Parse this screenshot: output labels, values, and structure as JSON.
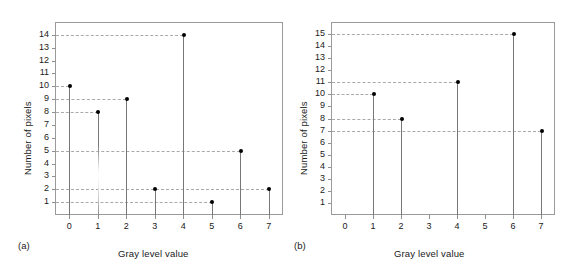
{
  "figure": {
    "background": "#ffffff",
    "marker_color": "#000000",
    "stem_color": "#777777",
    "grid_color": "#a9a9a9",
    "frame_color": "#9a9a9a"
  },
  "chart_data": [
    {
      "type": "bar",
      "panel": "(a)",
      "title": "",
      "xlabel": "Gray level value",
      "ylabel": "Number of pixels",
      "categories": [
        "0",
        "1",
        "2",
        "3",
        "4",
        "5",
        "6",
        "7"
      ],
      "values": [
        10,
        8,
        9,
        2,
        14,
        1,
        5,
        2
      ],
      "xlim": [
        -0.5,
        7.5
      ],
      "ylim": [
        0,
        15
      ],
      "yticks": [
        1,
        2,
        3,
        4,
        5,
        6,
        7,
        8,
        9,
        10,
        11,
        12,
        13,
        14
      ],
      "ytick_labels": [
        "1",
        "2",
        "3",
        "4",
        "5",
        "6",
        "7",
        "8",
        "9",
        "10",
        "11",
        "12",
        "13",
        "14"
      ],
      "xticks": [
        0,
        1,
        2,
        3,
        4,
        5,
        6,
        7
      ],
      "xtick_labels": [
        "0",
        "1",
        "2",
        "3",
        "4",
        "5",
        "6",
        "7"
      ],
      "grid": "horizontal-dashed-guides",
      "guides_at": [
        14,
        10,
        9,
        8,
        5,
        2,
        1
      ],
      "legend": "none",
      "annotations": []
    },
    {
      "type": "bar",
      "panel": "(b)",
      "title": "",
      "xlabel": "Gray level value",
      "ylabel": "Number of pixels",
      "categories": [
        "0",
        "1",
        "2",
        "3",
        "4",
        "5",
        "6",
        "7"
      ],
      "values": [
        0,
        10,
        8,
        0,
        11,
        0,
        15,
        7
      ],
      "xlim": [
        -0.5,
        7.5
      ],
      "ylim": [
        0,
        16
      ],
      "yticks": [
        1,
        2,
        3,
        4,
        5,
        6,
        7,
        8,
        9,
        10,
        11,
        12,
        13,
        14,
        15
      ],
      "ytick_labels": [
        "1",
        "2",
        "3",
        "4",
        "5",
        "6",
        "7",
        "8",
        "9",
        "10",
        "11",
        "12",
        "13",
        "14",
        "15"
      ],
      "xticks": [
        0,
        1,
        2,
        3,
        4,
        5,
        6,
        7
      ],
      "xtick_labels": [
        "0",
        "1",
        "2",
        "3",
        "4",
        "5",
        "6",
        "7"
      ],
      "grid": "horizontal-dashed-guides",
      "guides_at": [
        15,
        11,
        10,
        8,
        7
      ],
      "legend": "none",
      "annotations": []
    }
  ]
}
